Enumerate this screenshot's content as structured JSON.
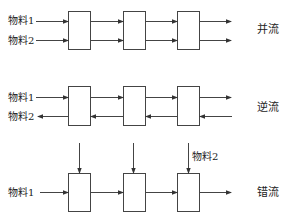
{
  "diagram": {
    "rows": [
      {
        "id": "parallel",
        "title": "并流",
        "inputs": [
          {
            "label": "物料1",
            "direction": "right"
          },
          {
            "label": "物料2",
            "direction": "right"
          }
        ],
        "stages": 3
      },
      {
        "id": "counter",
        "title": "逆流",
        "inputs": [
          {
            "label": "物料1",
            "direction": "right"
          },
          {
            "label": "物料2",
            "direction": "left"
          }
        ],
        "stages": 3
      },
      {
        "id": "cross",
        "title": "错流",
        "inputs": [
          {
            "label": "物料1",
            "direction": "right"
          },
          {
            "label": "物料2",
            "direction": "down"
          }
        ],
        "stages": 3
      }
    ]
  }
}
